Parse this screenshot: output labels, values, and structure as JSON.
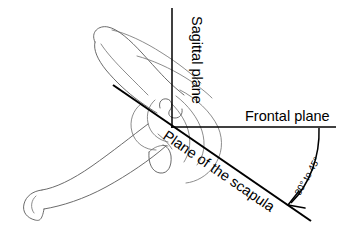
{
  "figure": {
    "kind": "anatomical-line-diagram",
    "background_color": "#ffffff",
    "line_color": "#000000",
    "bone_outline_color": "#5a5a5a"
  },
  "labels": {
    "sagittal_plane": "Sagittal plane",
    "frontal_plane": "Frontal plane",
    "plane_of_the_scapula": "Plane of the scapula",
    "angle_range": "30° to 45°"
  },
  "axes": {
    "sagittal": {
      "label": "Sagittal plane",
      "orientation": "vertical",
      "from": [
        172,
        8
      ],
      "to": [
        172,
        127
      ]
    },
    "frontal": {
      "label": "Frontal plane",
      "orientation": "horizontal",
      "from": [
        172,
        127
      ],
      "to": [
        336,
        127
      ]
    },
    "scapular": {
      "label": "Plane of the scapula",
      "orientation": "oblique",
      "from": [
        113,
        85
      ],
      "to": [
        311,
        221
      ]
    }
  },
  "angle_arc": {
    "text": "30° to 45°",
    "min_degrees": 30,
    "max_degrees": 45,
    "between": [
      "Frontal plane",
      "Plane of the scapula"
    ],
    "arc_start": [
      319,
      128
    ],
    "arc_end": [
      289,
      205
    ],
    "arrow_at": "arc_end"
  },
  "bone_parts": [
    "acromion process",
    "scapular spine",
    "glenoid fossa",
    "coracoid process",
    "scapular body",
    "medial border"
  ]
}
